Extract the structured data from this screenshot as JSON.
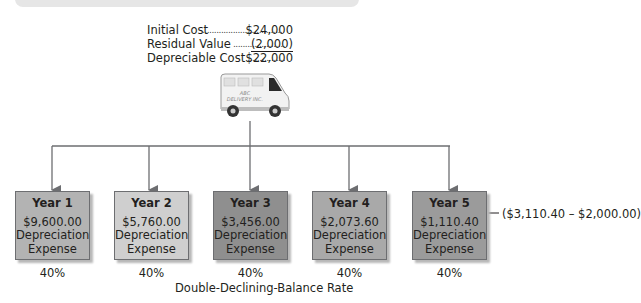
{
  "cost_table": {
    "rows": [
      {
        "label": "Initial Cost",
        "dots": "........................................",
        "value": "$24,000"
      },
      {
        "label": "Residual Value",
        "dots": "........................................",
        "value": "(2,000)"
      },
      {
        "label": "Depreciable Cost",
        "dots": "........................................",
        "value": "$22,000"
      }
    ]
  },
  "asset": {
    "icon": "delivery-van-icon",
    "name_line1": "ABC",
    "name_line2": "DELIVERY INC."
  },
  "years": [
    {
      "title": "Year 1",
      "amount": "$9,600.00",
      "label1": "Depreciation",
      "label2": "Expense",
      "rate": "40%",
      "color": "#b3b3b3"
    },
    {
      "title": "Year 2",
      "amount": "$5,760.00",
      "label1": "Depreciation",
      "label2": "Expense",
      "rate": "40%",
      "color": "#cfcfcf"
    },
    {
      "title": "Year 3",
      "amount": "$3,456.00",
      "label1": "Depreciation",
      "label2": "Expense",
      "rate": "40%",
      "color": "#8f8f8f"
    },
    {
      "title": "Year 4",
      "amount": "$2,073.60",
      "label1": "Depreciation",
      "label2": "Expense",
      "rate": "40%",
      "color": "#a9a9a9"
    },
    {
      "title": "Year 5",
      "amount": "$1,110.40",
      "label1": "Depreciation",
      "label2": "Expense",
      "rate": "40%",
      "color": "#9b9b9b"
    }
  ],
  "annotation": "($3,110.40 – $2,000.00)",
  "rate_caption": "Double-Declining-Balance Rate",
  "colors": {
    "connector": "#6d6e71",
    "text": "#231f20",
    "header_bar": "#e6e6e6"
  }
}
